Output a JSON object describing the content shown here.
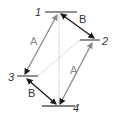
{
  "diagram": {
    "levels": [
      {
        "id": "1",
        "label": "1"
      },
      {
        "id": "2",
        "label": "2"
      },
      {
        "id": "3",
        "label": "3"
      },
      {
        "id": "4",
        "label": "4"
      }
    ],
    "transitions": [
      {
        "from": "3",
        "to": "1",
        "label": "A",
        "style": "solid",
        "color": "#8a8a8a",
        "arrow": "single"
      },
      {
        "from": "4",
        "to": "2",
        "label": "A",
        "style": "solid",
        "color": "#8a8a8a",
        "arrow": "single"
      },
      {
        "from": "1",
        "to": "2",
        "label": "B",
        "style": "solid",
        "color": "#1a1a1a",
        "arrow": "double"
      },
      {
        "from": "3",
        "to": "4",
        "label": "B",
        "style": "solid",
        "color": "#1a1a1a",
        "arrow": "double"
      },
      {
        "from": "1",
        "to": "4",
        "label": "",
        "style": "dotted",
        "color": "#b0b0b0",
        "arrow": "none"
      },
      {
        "from": "2",
        "to": "3",
        "label": "",
        "style": "dotted",
        "color": "#b0b0b0",
        "arrow": "none"
      }
    ],
    "colors": {
      "level_line": "#555555",
      "transition_a": "#8a8a8a",
      "transition_b": "#1a1a1a",
      "dotted": "#b0b0b0",
      "label_a": "#8a8a8a",
      "label_b": "#333333"
    }
  }
}
